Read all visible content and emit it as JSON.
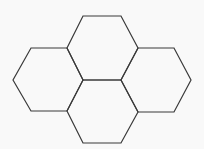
{
  "diagram": {
    "type": "hexagon-cluster",
    "background": "#f9f9f9",
    "stroke_color": "#3a3a3a",
    "stroke_width": 1.2,
    "hexagons": [
      {
        "id": "top",
        "points": [
          [
            83,
            16
          ],
          [
            121,
            16
          ],
          [
            138,
            48
          ],
          [
            121,
            80
          ],
          [
            83,
            80
          ],
          [
            67,
            48
          ]
        ]
      },
      {
        "id": "left",
        "points": [
          [
            31,
            48
          ],
          [
            67,
            48
          ],
          [
            83,
            80
          ],
          [
            67,
            111
          ],
          [
            31,
            111
          ],
          [
            13,
            80
          ]
        ]
      },
      {
        "id": "right",
        "points": [
          [
            138,
            48
          ],
          [
            174,
            48
          ],
          [
            191,
            80
          ],
          [
            174,
            112
          ],
          [
            138,
            112
          ],
          [
            121,
            80
          ]
        ]
      },
      {
        "id": "middle",
        "points": [
          [
            83,
            80
          ],
          [
            121,
            80
          ],
          [
            138,
            112
          ],
          [
            121,
            143
          ],
          [
            83,
            143
          ],
          [
            67,
            111
          ]
        ]
      }
    ]
  }
}
